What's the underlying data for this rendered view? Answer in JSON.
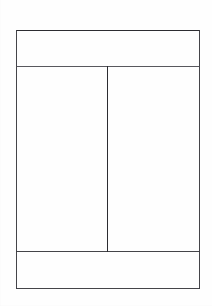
{
  "document": {
    "title": "Page Layout Diagram",
    "kind": "line-drawing",
    "background_color": "#fefefe",
    "stroke_color": "#3a3a3e",
    "canvas": {
      "width": 212,
      "height": 306
    }
  },
  "frame": {
    "name": "outer-frame",
    "left": 16,
    "top": 30,
    "right": 199,
    "bottom": 288,
    "width": 183,
    "height": 258
  },
  "lines": [
    {
      "id": "frame-top",
      "name": "frame-top-edge",
      "orientation": "h",
      "x": 16,
      "y": 30,
      "length": 184,
      "weight": "ink-dark"
    },
    {
      "id": "frame-bottom",
      "name": "frame-bottom-edge",
      "orientation": "h",
      "x": 16,
      "y": 288,
      "length": 184,
      "weight": "ink-medium"
    },
    {
      "id": "frame-left",
      "name": "frame-left-edge",
      "orientation": "v",
      "x": 16,
      "y": 30,
      "length": 259,
      "weight": "ink-medium"
    },
    {
      "id": "frame-right",
      "name": "frame-right-edge",
      "orientation": "v",
      "x": 199,
      "y": 30,
      "length": 259,
      "weight": "ink-medium"
    },
    {
      "id": "header-rule",
      "name": "header-divider-rule",
      "orientation": "h",
      "x": 16,
      "y": 66,
      "length": 184,
      "weight": "ink-soft"
    },
    {
      "id": "footer-rule",
      "name": "footer-divider-rule",
      "orientation": "h",
      "x": 16,
      "y": 251,
      "length": 184,
      "weight": "ink-medium"
    },
    {
      "id": "column-divider",
      "name": "column-divider-rule",
      "orientation": "v",
      "x": 107,
      "y": 66,
      "length": 186,
      "weight": "ink-dark"
    }
  ],
  "regions": [
    {
      "id": "header",
      "name": "header-band",
      "x": 17,
      "y": 31,
      "width": 182,
      "height": 35
    },
    {
      "id": "left-column",
      "name": "left-column-area",
      "x": 17,
      "y": 67,
      "width": 90,
      "height": 184
    },
    {
      "id": "right-column",
      "name": "right-column-area",
      "x": 108,
      "y": 67,
      "width": 91,
      "height": 184
    },
    {
      "id": "footer",
      "name": "footer-band",
      "x": 17,
      "y": 252,
      "width": 182,
      "height": 36
    }
  ]
}
